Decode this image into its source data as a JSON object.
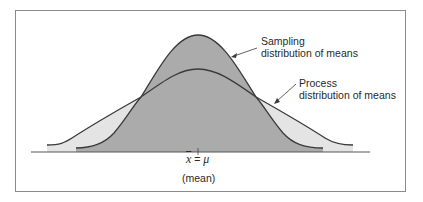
{
  "diagram": {
    "type": "overlapping-normal-distributions",
    "colors": {
      "process_fill": "#e4e4e4",
      "sampling_fill": "#ababab",
      "stroke": "#3a3a3a",
      "frame": "#8a8a8a"
    },
    "labels": {
      "sampling_line1": "Sampling",
      "sampling_line2": "distribution of means",
      "process_line1": "Process",
      "process_line2": "distribution of means",
      "xbar_symbol": "x",
      "equals": "=",
      "mu_symbol": "μ",
      "mean_caption": "(mean)"
    }
  }
}
